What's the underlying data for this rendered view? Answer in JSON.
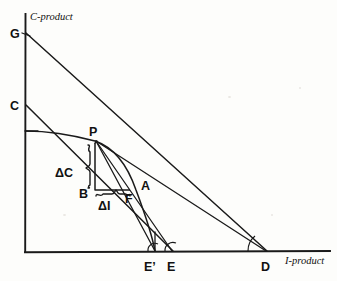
{
  "figure": {
    "type": "economics-production-possibility-diagram",
    "background_color": "#fdfdfb",
    "ink_color": "#1a1a1a"
  },
  "axes": {
    "y_label": "C-product",
    "x_label": "I-product",
    "origin": {
      "x": 25,
      "y": 252
    },
    "y_top": {
      "x": 25,
      "y": 14
    },
    "x_right": {
      "x": 330,
      "y": 252
    }
  },
  "points": [
    {
      "id": "G",
      "label": "G",
      "x": 25,
      "y": 33,
      "label_x": 10,
      "label_y": 37
    },
    {
      "id": "C",
      "label": "C",
      "x": 25,
      "y": 105,
      "label_x": 10,
      "label_y": 109
    },
    {
      "id": "P",
      "label": "P",
      "x": 95,
      "y": 140,
      "label_x": 90,
      "label_y": 135
    },
    {
      "id": "B",
      "label": "B",
      "x": 95,
      "y": 190,
      "label_x": 83,
      "label_y": 196
    },
    {
      "id": "A",
      "label": "A",
      "x": 140,
      "y": 183,
      "label_x": 141,
      "label_y": 189
    },
    {
      "id": "F",
      "label": "F",
      "x": 129,
      "y": 190,
      "label_x": 126,
      "label_y": 201
    },
    {
      "id": "E'",
      "label": "E’",
      "x": 155,
      "y": 252,
      "label_x": 147,
      "label_y": 269
    },
    {
      "id": "E",
      "label": "E",
      "x": 173,
      "y": 252,
      "label_x": 170,
      "label_y": 269
    },
    {
      "id": "D",
      "label": "D",
      "x": 267,
      "y": 252,
      "label_x": 262,
      "label_y": 269
    }
  ],
  "annotations": [
    {
      "id": "delta-c",
      "label": "ΔC",
      "x": 59,
      "y": 172,
      "describes": "vertical change in C-product between P and B"
    },
    {
      "id": "delta-i",
      "label": "ΔI",
      "x": 101,
      "y": 205,
      "describes": "horizontal change in I-product between B and F"
    }
  ],
  "lines": [
    {
      "id": "budget-line-G-D",
      "from": "G",
      "to": "D",
      "kind": "straight"
    },
    {
      "id": "price-line-C-E",
      "from": "C",
      "to": "E",
      "kind": "straight"
    },
    {
      "id": "ray-P-E-prime",
      "from": "P",
      "to": "E'",
      "kind": "straight"
    },
    {
      "id": "ray-P-E",
      "from": "P",
      "to": "E",
      "kind": "straight"
    },
    {
      "id": "ray-P-D",
      "from": "P",
      "to": "D",
      "kind": "straight"
    },
    {
      "id": "transformation-curve",
      "from": "C-axis-tick",
      "to": "E'",
      "kind": "concave-curve"
    }
  ],
  "angles": [
    {
      "id": "angle-at-E-prime",
      "vertex": "E'"
    },
    {
      "id": "angle-at-E",
      "vertex": "E"
    },
    {
      "id": "angle-at-D",
      "vertex": "D"
    }
  ]
}
